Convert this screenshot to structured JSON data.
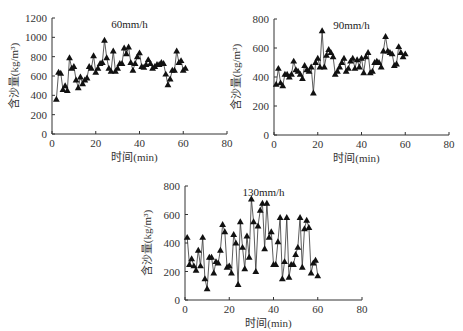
{
  "chart_data": [
    {
      "type": "line",
      "title": "60mm/h",
      "xlabel": "时间(min)",
      "ylabel": "含沙量(kg/m³)",
      "xlim": [
        0,
        80
      ],
      "ylim": [
        0,
        1200
      ],
      "xticks": [
        0,
        20,
        40,
        60,
        80
      ],
      "yticks": [
        0,
        200,
        400,
        600,
        800,
        1000,
        1200
      ],
      "marker": "triangle",
      "series": [
        {
          "name": "60mm/h",
          "x": [
            2,
            3,
            4,
            5,
            6,
            7,
            8,
            9,
            10,
            11,
            12,
            13,
            14,
            15,
            16,
            17,
            18,
            19,
            20,
            21,
            22,
            23,
            24,
            25,
            26,
            27,
            28,
            29,
            30,
            31,
            32,
            33,
            34,
            35,
            36,
            37,
            38,
            39,
            40,
            41,
            42,
            43,
            44,
            45,
            46,
            47,
            48,
            49,
            50,
            51,
            52,
            53,
            54,
            55,
            56,
            57,
            58,
            59,
            60,
            61
          ],
          "y": [
            360,
            640,
            630,
            460,
            500,
            450,
            790,
            680,
            700,
            560,
            480,
            590,
            520,
            560,
            580,
            700,
            680,
            810,
            640,
            680,
            730,
            740,
            970,
            790,
            680,
            650,
            860,
            650,
            680,
            730,
            730,
            890,
            830,
            900,
            740,
            660,
            730,
            800,
            840,
            700,
            690,
            720,
            770,
            730,
            680,
            700,
            720,
            720,
            740,
            730,
            620,
            510,
            570,
            660,
            660,
            860,
            740,
            760,
            660,
            680
          ]
        }
      ]
    },
    {
      "type": "line",
      "title": "90mm/h",
      "xlabel": "时间(min)",
      "ylabel": "含沙量(kg/m³)",
      "xlim": [
        0,
        80
      ],
      "ylim": [
        0,
        800
      ],
      "xticks": [
        0,
        20,
        40,
        60,
        80
      ],
      "yticks": [
        0,
        200,
        400,
        600,
        800
      ],
      "marker": "triangle",
      "series": [
        {
          "name": "90mm/h",
          "x": [
            1,
            2,
            3,
            4,
            5,
            6,
            7,
            8,
            9,
            10,
            11,
            12,
            13,
            14,
            15,
            16,
            17,
            18,
            19,
            20,
            21,
            22,
            23,
            24,
            25,
            26,
            27,
            28,
            29,
            30,
            31,
            32,
            33,
            34,
            35,
            36,
            37,
            38,
            39,
            40,
            41,
            42,
            43,
            44,
            45,
            46,
            47,
            48,
            49,
            50,
            51,
            52,
            53,
            54,
            55,
            56,
            57,
            58,
            59,
            60
          ],
          "y": [
            350,
            460,
            360,
            340,
            420,
            420,
            400,
            420,
            510,
            450,
            440,
            420,
            390,
            480,
            450,
            440,
            470,
            290,
            500,
            530,
            470,
            720,
            470,
            550,
            590,
            570,
            540,
            420,
            440,
            470,
            500,
            530,
            440,
            460,
            510,
            530,
            460,
            520,
            470,
            530,
            430,
            540,
            570,
            430,
            440,
            500,
            510,
            500,
            470,
            580,
            680,
            580,
            570,
            560,
            480,
            490,
            610,
            570,
            540,
            560
          ]
        }
      ]
    },
    {
      "type": "line",
      "title": "130mm/h",
      "xlabel": "时间(min)",
      "ylabel": "含沙量(kg/m³)",
      "xlim": [
        0,
        80
      ],
      "ylim": [
        0,
        800
      ],
      "xticks": [
        0,
        20,
        40,
        60,
        80
      ],
      "yticks": [
        0,
        200,
        400,
        600,
        800
      ],
      "marker": "triangle",
      "series": [
        {
          "name": "130mm/h",
          "x": [
            1,
            2,
            3,
            4,
            5,
            6,
            7,
            8,
            9,
            10,
            11,
            12,
            13,
            14,
            15,
            16,
            17,
            18,
            19,
            20,
            21,
            22,
            23,
            24,
            25,
            26,
            27,
            28,
            29,
            30,
            31,
            32,
            33,
            34,
            35,
            36,
            37,
            38,
            39,
            40,
            41,
            42,
            43,
            44,
            45,
            46,
            47,
            48,
            49,
            50,
            51,
            52,
            53,
            54,
            55,
            56,
            57,
            58,
            59,
            60
          ],
          "y": [
            440,
            250,
            290,
            240,
            210,
            350,
            240,
            440,
            150,
            80,
            300,
            300,
            190,
            270,
            260,
            350,
            530,
            480,
            230,
            240,
            190,
            460,
            400,
            110,
            550,
            370,
            220,
            450,
            300,
            710,
            550,
            200,
            520,
            630,
            680,
            360,
            680,
            440,
            480,
            250,
            250,
            410,
            580,
            150,
            270,
            580,
            160,
            250,
            250,
            320,
            370,
            580,
            230,
            500,
            560,
            510,
            190,
            260,
            280,
            170
          ]
        }
      ]
    }
  ],
  "panels": [
    {
      "title": "60mm/h",
      "xlabel": "时间(min)",
      "ylabel": "含沙量(kg/m³)"
    },
    {
      "title": "90mm/h",
      "xlabel": "时间(min)",
      "ylabel": "含沙量(kg/m³)"
    },
    {
      "title": "130mm/h",
      "xlabel": "时间(min)",
      "ylabel": "含沙量(kg/m³)"
    }
  ]
}
